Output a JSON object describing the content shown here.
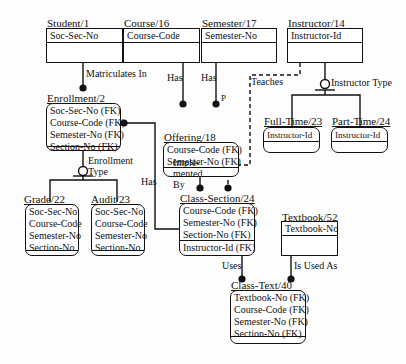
{
  "diagram": {
    "type": "IDEF1X data model",
    "entities": [
      {
        "id": "student",
        "label": "Student/1",
        "keys": [
          "Soc-Sec-No"
        ],
        "nonkeys": [],
        "dependent": false
      },
      {
        "id": "course",
        "label": "Course/16",
        "keys": [
          "Course-Code"
        ],
        "nonkeys": [],
        "dependent": false
      },
      {
        "id": "semester",
        "label": "Semester/17",
        "keys": [
          "Semester-No"
        ],
        "nonkeys": [],
        "dependent": false
      },
      {
        "id": "instructor",
        "label": "Instructor/14",
        "keys": [
          "Instructor-Id"
        ],
        "nonkeys": [],
        "dependent": false
      },
      {
        "id": "enrollment",
        "label": "Enrollment/2",
        "keys": [
          "Soc-Sec-No (FK)",
          "Course-Code (FK)",
          "Semester-No (FK)",
          "Section-No (FK)"
        ],
        "nonkeys": [],
        "dependent": true
      },
      {
        "id": "offering",
        "label": "Offering/18",
        "keys": [
          "Course-Code (FK)",
          "Semester-No (FK)"
        ],
        "nonkeys": [],
        "dependent": true
      },
      {
        "id": "full_time",
        "label": "Full-Time/23",
        "keys": [
          "Instructor-Id"
        ],
        "nonkeys": [],
        "dependent": true
      },
      {
        "id": "part_time",
        "label": "Part-Time/24",
        "keys": [
          "Instructor-Id"
        ],
        "nonkeys": [],
        "dependent": true
      },
      {
        "id": "grade",
        "label": "Grade/22",
        "keys": [
          "Soc-Sec-No",
          "Course-Code",
          "Semester-No",
          "Section-No"
        ],
        "nonkeys": [],
        "dependent": true
      },
      {
        "id": "audit",
        "label": "Audit/23",
        "keys": [
          "Soc-Sec-No",
          "Course-Code",
          "Semester-No",
          "Section-No"
        ],
        "nonkeys": [],
        "dependent": true
      },
      {
        "id": "class_section",
        "label": "Class-Section/24",
        "keys": [
          "Course-Code (FK)",
          "Semester-No (FK)",
          "Section-No (FK)"
        ],
        "nonkeys": [
          "Instructor-Id (FK)"
        ],
        "dependent": true
      },
      {
        "id": "textbook",
        "label": "Textbook/52",
        "keys": [
          "Textbook-No"
        ],
        "nonkeys": [],
        "dependent": false
      },
      {
        "id": "class_text",
        "label": "Class-Text/40",
        "keys": [
          "Textbook-No (FK)",
          "Course-Code (FK)",
          "Semester-No (FK)",
          "Section-No (FK)"
        ],
        "nonkeys": [],
        "dependent": true
      }
    ],
    "relationships": {
      "matriculates_in": "Matriculates In",
      "course_has": "Has",
      "semester_has": "Has",
      "semester_has_card": "P",
      "teaches": "Teaches",
      "instructor_type": "Instructor Type",
      "enrollment_type_1": "Enrollment",
      "enrollment_type_2": "Type",
      "enroll_has": "Has",
      "implemented_1": "Imple-",
      "implemented_2": "mented",
      "implemented_3": "By",
      "uses": "Uses",
      "is_used_as": "Is Used As"
    }
  }
}
